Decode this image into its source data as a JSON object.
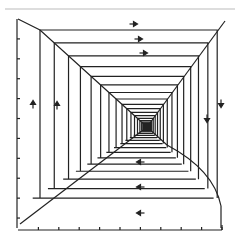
{
  "figure": {
    "type": "phase-portrait-spiral",
    "center": [
      147,
      127
    ],
    "colors": {
      "stroke": "#222222",
      "background": "#ffffff",
      "rule": "#bbbbbb"
    }
  },
  "arrows": [
    {
      "direction": "right",
      "x": 133,
      "y": 24
    },
    {
      "direction": "right",
      "x": 138,
      "y": 39
    },
    {
      "direction": "right",
      "x": 143,
      "y": 53
    },
    {
      "direction": "down",
      "x": 221,
      "y": 103
    },
    {
      "direction": "down",
      "x": 207,
      "y": 118
    },
    {
      "direction": "up",
      "x": 33,
      "y": 105
    },
    {
      "direction": "up",
      "x": 57,
      "y": 106
    },
    {
      "direction": "left",
      "x": 141,
      "y": 162
    },
    {
      "direction": "left",
      "x": 141,
      "y": 187
    },
    {
      "direction": "left",
      "x": 141,
      "y": 213
    }
  ],
  "axes": {
    "left": {
      "x": 17,
      "y_top": 19,
      "y_bottom": 228,
      "ticks": 10
    },
    "bottom": {
      "y": 230,
      "x_left": 18,
      "x_right": 222,
      "ticks": 10
    }
  }
}
